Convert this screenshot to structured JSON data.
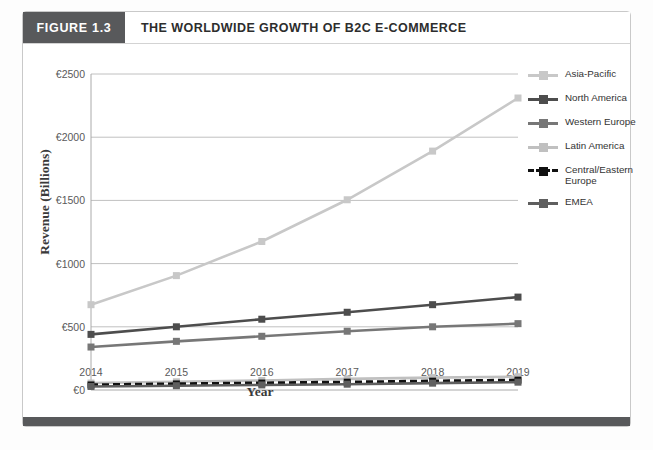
{
  "figure": {
    "tag": "FIGURE 1.3",
    "title": "THE WORLDWIDE GROWTH OF B2C E-COMMERCE"
  },
  "colors": {
    "tag_bar": "#58595b",
    "footer_bar": "#58595b",
    "card_border": "#c9c9c9",
    "gridline": "#c0c0c0",
    "axis": "#aaaaaa",
    "asia_pacific": "#c8c8c8",
    "north_america": "#4d4d4d",
    "western_europe": "#777777",
    "latin_america": "#c0c0c0",
    "central_eastern_europe": "#111111",
    "emea": "#5f5f5f"
  },
  "chart_data": {
    "type": "line",
    "title": "THE WORLDWIDE GROWTH OF B2C E-COMMERCE",
    "xlabel": "Year",
    "ylabel": "Revenue (Billions)",
    "categories": [
      "2014",
      "2015",
      "2016",
      "2017",
      "2018",
      "2019"
    ],
    "ylim": [
      0,
      2500
    ],
    "yticks": [
      0,
      500,
      1000,
      1500,
      2000,
      2500
    ],
    "ytick_labels": [
      "€0",
      "€500",
      "€1000",
      "€1500",
      "€2000",
      "€2500"
    ],
    "currency_symbol": "€",
    "grid": true,
    "legend_position": "right",
    "series": [
      {
        "name": "Asia-Pacific",
        "values": [
          675,
          905,
          1175,
          1505,
          1890,
          2310
        ],
        "color": "#c8c8c8",
        "dashed": false
      },
      {
        "name": "North America",
        "values": [
          440,
          500,
          560,
          615,
          675,
          735
        ],
        "color": "#4d4d4d",
        "dashed": false
      },
      {
        "name": "Western Europe",
        "values": [
          340,
          385,
          425,
          465,
          500,
          525
        ],
        "color": "#777777",
        "dashed": false
      },
      {
        "name": "Latin America",
        "values": [
          55,
          65,
          75,
          88,
          98,
          105
        ],
        "color": "#c0c0c0",
        "dashed": false
      },
      {
        "name": "Central/Eastern Europe",
        "values": [
          40,
          48,
          55,
          62,
          70,
          78
        ],
        "color": "#111111",
        "dashed": true
      },
      {
        "name": "EMEA",
        "values": [
          28,
          34,
          40,
          46,
          54,
          62
        ],
        "color": "#5f5f5f",
        "dashed": false
      }
    ]
  },
  "legend": {
    "items": [
      {
        "label": "Asia-Pacific"
      },
      {
        "label": "North America"
      },
      {
        "label": "Western Europe"
      },
      {
        "label": "Latin America"
      },
      {
        "label": "Central/Eastern Europe"
      },
      {
        "label": "EMEA"
      }
    ]
  }
}
